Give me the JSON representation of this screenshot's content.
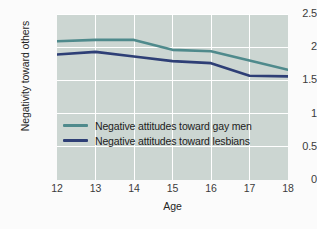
{
  "chart_data": {
    "type": "line",
    "title": "",
    "xlabel": "Age",
    "ylabel": "Negativity toward others",
    "x": [
      12,
      13,
      14,
      15,
      16,
      17,
      18
    ],
    "xtick_labels": [
      "12",
      "13",
      "14",
      "15",
      "16",
      "17",
      "18"
    ],
    "ytick_labels": [
      "0",
      "0.5",
      "1",
      "1.5",
      "2",
      "2.5"
    ],
    "ytick_values": [
      0,
      0.5,
      1,
      1.5,
      2,
      2.5
    ],
    "xlim": [
      12,
      18
    ],
    "ylim": [
      0,
      2.5
    ],
    "grid": true,
    "legend_position": "center-left",
    "plot_background": "#ccd6d2",
    "gridline_color": "#ffffff",
    "series": [
      {
        "name": "Negative attitudes toward gay men",
        "color": "#4f8a8c",
        "values": [
          2.09,
          2.11,
          2.11,
          1.96,
          1.94,
          1.8,
          1.66
        ]
      },
      {
        "name": "Negative attitudes toward lesbians",
        "color": "#2e3f76",
        "values": [
          1.89,
          1.93,
          1.86,
          1.79,
          1.76,
          1.57,
          1.56
        ]
      }
    ]
  },
  "legend": {
    "items": [
      {
        "label": "Negative attitudes toward gay men"
      },
      {
        "label": "Negative attitudes toward lesbians"
      }
    ]
  }
}
